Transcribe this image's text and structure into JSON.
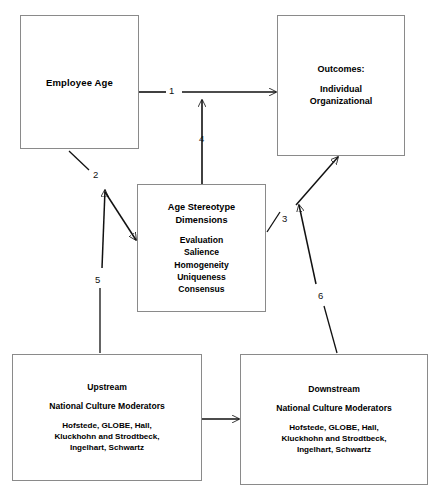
{
  "diagram": {
    "background_color": "#ffffff",
    "box_border_color": "#8a8a8a",
    "connector_color": "#111111",
    "nodes": {
      "employee_age": {
        "label": "Employee Age"
      },
      "outcomes": {
        "heading": "Outcomes:",
        "line1": "Individual",
        "line2": "Organizational"
      },
      "age_stereotype": {
        "heading1": "Age Stereotype",
        "heading2": "Dimensions",
        "item1": "Evaluation",
        "item2": "Salience",
        "item3": "Homogeneity",
        "item4": "Uniqueness",
        "item5": "Consensus"
      },
      "upstream": {
        "heading": "Upstream",
        "subheading": "National Culture Moderators",
        "line1": "Hofstede, GLOBE, Hall,",
        "line2": "Kluckhohn and Strodtbeck,",
        "line3": "Ingelhart, Schwartz"
      },
      "downstream": {
        "heading": "Downstream",
        "subheading": "National Culture Moderators",
        "line1": "Hofstede, GLOBE, Hall,",
        "line2": "Kluckhohn and Strodtbeck,",
        "line3": "Ingelhart, Schwartz"
      }
    },
    "edges": [
      {
        "id": "1",
        "label": "1",
        "from": "employee_age",
        "to": "outcomes"
      },
      {
        "id": "2",
        "label": "2",
        "from": "employee_age",
        "to": "age_stereotype"
      },
      {
        "id": "3",
        "label": "3",
        "from": "age_stereotype",
        "to": "outcomes"
      },
      {
        "id": "4",
        "label": "4",
        "from": "age_stereotype",
        "to": "outcomes_path"
      },
      {
        "id": "5",
        "label": "5",
        "from": "upstream",
        "to": "age_stereotype_path"
      },
      {
        "id": "6",
        "label": "6",
        "from": "downstream",
        "to": "outcomes_path"
      }
    ]
  }
}
